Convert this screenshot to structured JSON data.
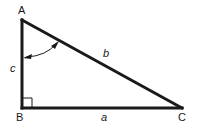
{
  "diagram": {
    "type": "right-triangle",
    "vertices": {
      "A": {
        "label": "A",
        "x": 22,
        "y": 20
      },
      "B": {
        "label": "B",
        "x": 22,
        "y": 108
      },
      "C": {
        "label": "C",
        "x": 182,
        "y": 108
      }
    },
    "sides": {
      "a": {
        "label": "a",
        "between": [
          "B",
          "C"
        ]
      },
      "b": {
        "label": "b",
        "between": [
          "A",
          "C"
        ]
      },
      "c": {
        "label": "c",
        "between": [
          "A",
          "B"
        ]
      }
    },
    "right_angle_at": "B",
    "angle_marker": {
      "at": "A",
      "style": "double-arrow arc"
    },
    "colors": {
      "stroke": "#1a1a1a",
      "background": "#ffffff"
    }
  }
}
